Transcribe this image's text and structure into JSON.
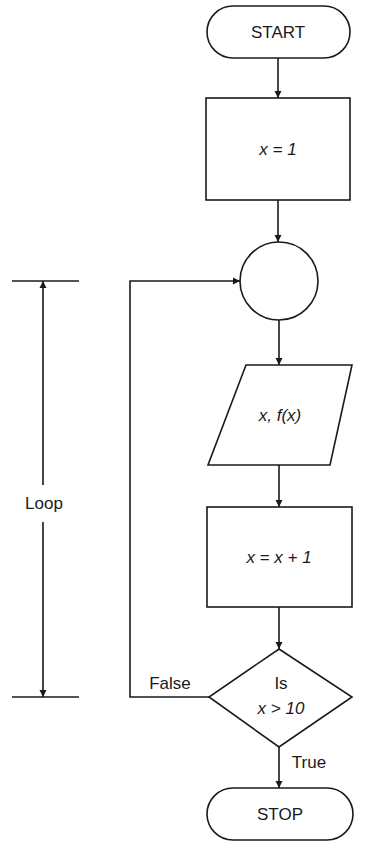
{
  "flowchart": {
    "start": {
      "label": "START"
    },
    "init": {
      "label": "x = 1"
    },
    "connector": {
      "label": ""
    },
    "output": {
      "label": "x, f(x)"
    },
    "increment": {
      "label": "x = x + 1"
    },
    "decision": {
      "line1": "Is",
      "line2": "x > 10"
    },
    "stop": {
      "label": "STOP"
    },
    "branches": {
      "false_label": "False",
      "true_label": "True"
    },
    "loop_label": "Loop"
  },
  "colors": {
    "stroke": "#1a1a1a",
    "background": "#ffffff"
  }
}
